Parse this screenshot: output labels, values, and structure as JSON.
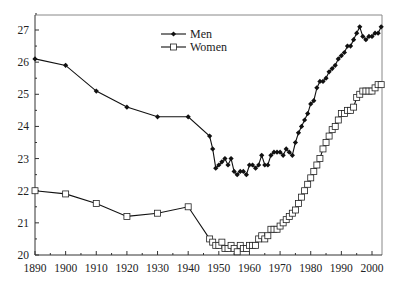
{
  "chart_data": {
    "type": "line",
    "title": "",
    "xlabel": "",
    "ylabel": "",
    "xlim": [
      1890,
      2004
    ],
    "ylim": [
      20,
      27.5
    ],
    "grid": false,
    "legend_position": "upper-center",
    "x_ticks": [
      1890,
      1900,
      1910,
      1920,
      1930,
      1940,
      1950,
      1960,
      1970,
      1980,
      1990,
      2000
    ],
    "y_ticks": [
      20,
      21,
      22,
      23,
      24,
      25,
      26,
      27
    ],
    "series": [
      {
        "name": "Men",
        "marker": "filled-diamond",
        "color": "#111111",
        "x": [
          1890,
          1900,
          1910,
          1920,
          1930,
          1940,
          1947,
          1948,
          1949,
          1950,
          1951,
          1952,
          1953,
          1954,
          1955,
          1956,
          1957,
          1958,
          1959,
          1960,
          1961,
          1962,
          1963,
          1964,
          1965,
          1966,
          1967,
          1968,
          1969,
          1970,
          1971,
          1972,
          1973,
          1974,
          1975,
          1976,
          1977,
          1978,
          1979,
          1980,
          1981,
          1982,
          1983,
          1984,
          1985,
          1986,
          1987,
          1988,
          1989,
          1990,
          1991,
          1992,
          1993,
          1994,
          1995,
          1996,
          1997,
          1998,
          1999,
          2000,
          2001,
          2002,
          2003
        ],
        "values": [
          26.1,
          25.9,
          25.1,
          24.6,
          24.3,
          24.3,
          23.7,
          23.3,
          22.7,
          22.8,
          22.9,
          23.0,
          22.8,
          23.0,
          22.6,
          22.5,
          22.6,
          22.6,
          22.5,
          22.8,
          22.8,
          22.7,
          22.8,
          23.1,
          22.8,
          22.8,
          23.1,
          23.2,
          23.2,
          23.2,
          23.1,
          23.3,
          23.2,
          23.1,
          23.5,
          23.8,
          24.0,
          24.2,
          24.4,
          24.7,
          24.8,
          25.2,
          25.4,
          25.4,
          25.5,
          25.7,
          25.8,
          25.9,
          26.1,
          26.2,
          26.3,
          26.5,
          26.5,
          26.7,
          26.9,
          27.1,
          26.8,
          26.7,
          26.8,
          26.8,
          26.9,
          26.9,
          27.1
        ]
      },
      {
        "name": "Women",
        "marker": "open-square",
        "color": "#111111",
        "x": [
          1890,
          1900,
          1910,
          1920,
          1930,
          1940,
          1947,
          1948,
          1949,
          1950,
          1951,
          1952,
          1953,
          1954,
          1955,
          1956,
          1957,
          1958,
          1959,
          1960,
          1961,
          1962,
          1963,
          1964,
          1965,
          1966,
          1967,
          1968,
          1969,
          1970,
          1971,
          1972,
          1973,
          1974,
          1975,
          1976,
          1977,
          1978,
          1979,
          1980,
          1981,
          1982,
          1983,
          1984,
          1985,
          1986,
          1987,
          1988,
          1989,
          1990,
          1991,
          1992,
          1993,
          1994,
          1995,
          1996,
          1997,
          1998,
          1999,
          2000,
          2001,
          2002,
          2003
        ],
        "values": [
          22.0,
          21.9,
          21.6,
          21.2,
          21.3,
          21.5,
          20.5,
          20.4,
          20.3,
          20.3,
          20.4,
          20.2,
          20.2,
          20.3,
          20.2,
          20.1,
          20.3,
          20.2,
          20.2,
          20.3,
          20.3,
          20.3,
          20.5,
          20.6,
          20.5,
          20.6,
          20.8,
          20.8,
          20.8,
          20.9,
          21.0,
          21.1,
          21.2,
          21.3,
          21.4,
          21.6,
          21.8,
          22.0,
          22.2,
          22.4,
          22.6,
          22.8,
          23.0,
          23.3,
          23.5,
          23.7,
          23.9,
          24.0,
          24.2,
          24.4,
          24.4,
          24.5,
          24.5,
          24.6,
          24.9,
          25.0,
          25.1,
          25.1,
          25.1,
          25.1,
          25.2,
          25.3,
          25.3
        ]
      }
    ]
  },
  "legend": {
    "items": [
      {
        "label": "Men",
        "marker": "filled-diamond"
      },
      {
        "label": "Women",
        "marker": "open-square"
      }
    ]
  },
  "axes": {
    "x_tick_labels": [
      "1890",
      "1900",
      "1910",
      "1920",
      "1930",
      "1940",
      "1950",
      "1960",
      "1970",
      "1980",
      "1990",
      "2000"
    ],
    "y_tick_labels": [
      "20",
      "21",
      "22",
      "23",
      "24",
      "25",
      "26",
      "27"
    ]
  }
}
